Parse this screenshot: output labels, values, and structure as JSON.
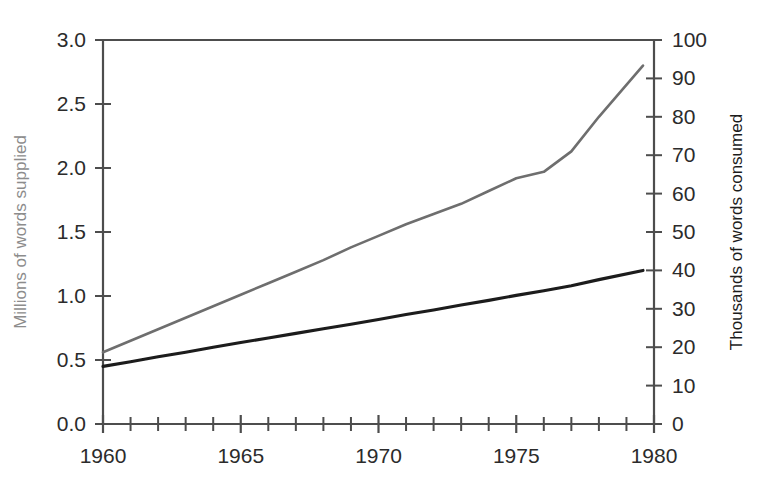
{
  "chart_data": {
    "type": "line",
    "title": "",
    "subtitle": "",
    "xlabel": "",
    "ylabel": "Millions of words supplied",
    "y2label": "Thousands of words consumed",
    "xlim": [
      1960,
      1980
    ],
    "ylim": [
      0.0,
      3.0
    ],
    "y2lim": [
      0,
      100
    ],
    "grid": false,
    "legend_position": "none",
    "x_ticks_major": [
      1960,
      1965,
      1970,
      1975,
      1980
    ],
    "x_tick_labels": [
      "1960",
      "1965",
      "1970",
      "1975",
      "1980"
    ],
    "x_ticks_minor": [
      1961,
      1962,
      1963,
      1964,
      1966,
      1967,
      1968,
      1969,
      1971,
      1972,
      1973,
      1974,
      1976,
      1977,
      1978,
      1979
    ],
    "y_ticks": [
      0.0,
      0.5,
      1.0,
      1.5,
      2.0,
      2.5,
      3.0
    ],
    "y_tick_labels": [
      "0.0",
      "0.5",
      "1.0",
      "1.5",
      "2.0",
      "2.5",
      "3.0"
    ],
    "y2_ticks": [
      0,
      10,
      20,
      30,
      40,
      50,
      60,
      70,
      80,
      90,
      100
    ],
    "y2_tick_labels": [
      "0",
      "10",
      "20",
      "30",
      "40",
      "50",
      "60",
      "70",
      "80",
      "90",
      "100"
    ],
    "x": [
      1960,
      1961,
      1962,
      1963,
      1964,
      1965,
      1966,
      1967,
      1968,
      1969,
      1970,
      1971,
      1972,
      1973,
      1974,
      1975,
      1976,
      1977,
      1978,
      1979.6
    ],
    "series": [
      {
        "name": "Millions of words supplied",
        "axis": "left",
        "color": "#6e6e6e",
        "values": [
          0.56,
          0.65,
          0.74,
          0.83,
          0.92,
          1.01,
          1.1,
          1.19,
          1.28,
          1.38,
          1.47,
          1.56,
          1.64,
          1.72,
          1.82,
          1.92,
          1.97,
          2.13,
          2.4,
          2.8
        ]
      },
      {
        "name": "Thousands of words consumed",
        "axis": "right",
        "color": "#1c1c1c",
        "values": [
          15.0,
          16.2,
          17.5,
          18.7,
          20.0,
          21.2,
          22.4,
          23.6,
          24.8,
          26.0,
          27.2,
          28.5,
          29.7,
          31.0,
          32.2,
          33.5,
          34.7,
          36.0,
          37.6,
          40.0
        ]
      }
    ]
  },
  "axes": {
    "left_title": "Millions of words supplied",
    "right_title": "Thousands of words consumed"
  },
  "ticks": {
    "left": [
      "3.0",
      "2.5",
      "2.0",
      "1.5",
      "1.0",
      "0.5",
      "0.0"
    ],
    "right": [
      "100",
      "90",
      "80",
      "70",
      "60",
      "50",
      "40",
      "30",
      "20",
      "10",
      "0"
    ],
    "bottom": [
      "1960",
      "1965",
      "1970",
      "1975",
      "1980"
    ]
  },
  "colors": {
    "supplied_line": "#6e6e6e",
    "consumed_line": "#1c1c1c",
    "axis": "#4d4d4d",
    "background": "#ffffff"
  }
}
